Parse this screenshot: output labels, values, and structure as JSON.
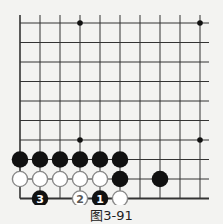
{
  "diagram": {
    "type": "go-board-fragment",
    "grid": {
      "cols": 10,
      "rows": 10,
      "origin_x": 20,
      "origin_y": 23,
      "step_x": 20,
      "step_y": 19.5
    },
    "star_points": [
      [
        3,
        0
      ],
      [
        9,
        0
      ],
      [
        3,
        6
      ],
      [
        9,
        6
      ]
    ],
    "stones": [
      {
        "col": 0,
        "row": 7,
        "color": "black",
        "label": ""
      },
      {
        "col": 1,
        "row": 7,
        "color": "black",
        "label": ""
      },
      {
        "col": 2,
        "row": 7,
        "color": "black",
        "label": ""
      },
      {
        "col": 3,
        "row": 7,
        "color": "black",
        "label": ""
      },
      {
        "col": 4,
        "row": 7,
        "color": "black",
        "label": ""
      },
      {
        "col": 5,
        "row": 7,
        "color": "black",
        "label": ""
      },
      {
        "col": 0,
        "row": 8,
        "color": "white",
        "label": ""
      },
      {
        "col": 1,
        "row": 8,
        "color": "white",
        "label": ""
      },
      {
        "col": 2,
        "row": 8,
        "color": "white",
        "label": ""
      },
      {
        "col": 3,
        "row": 8,
        "color": "white",
        "label": ""
      },
      {
        "col": 4,
        "row": 8,
        "color": "white",
        "label": ""
      },
      {
        "col": 5,
        "row": 8,
        "color": "black",
        "label": ""
      },
      {
        "col": 7,
        "row": 8,
        "color": "black",
        "label": ""
      },
      {
        "col": 1,
        "row": 9,
        "color": "black",
        "label": "3"
      },
      {
        "col": 3,
        "row": 9,
        "color": "white",
        "label": "2"
      },
      {
        "col": 4,
        "row": 9,
        "color": "black",
        "label": "1"
      },
      {
        "col": 5,
        "row": 9,
        "color": "white",
        "label": ""
      }
    ],
    "caption": "图3-91"
  }
}
